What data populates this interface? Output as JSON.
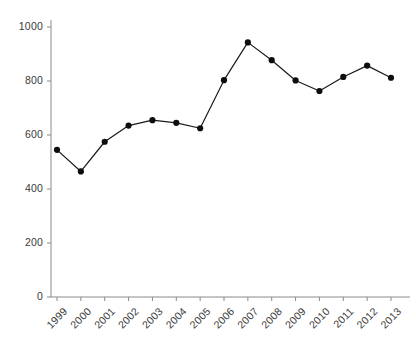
{
  "chart_data": {
    "type": "line",
    "title": "",
    "subtitle": "",
    "xlabel": "",
    "ylabel": "",
    "categories": [
      "1999",
      "2000",
      "2001",
      "2002",
      "2003",
      "2004",
      "2005",
      "2006",
      "2007",
      "2008",
      "2009",
      "2010",
      "2011",
      "2012",
      "2013"
    ],
    "values": [
      545,
      465,
      575,
      635,
      655,
      645,
      625,
      803,
      943,
      877,
      802,
      763,
      815,
      857,
      812
    ],
    "series": [
      {
        "name": "",
        "values": [
          545,
          465,
          575,
          635,
          655,
          645,
          625,
          803,
          943,
          877,
          802,
          763,
          815,
          857,
          812
        ]
      }
    ],
    "ylim": [
      0,
      1000
    ],
    "yticks": [
      0,
      200,
      400,
      600,
      800,
      1000
    ],
    "ytick_labels": [
      "0",
      "200",
      "400",
      "600",
      "800",
      "1000"
    ],
    "xtick_labels": [
      "1999",
      "2000",
      "2001",
      "2002",
      "2003",
      "2004",
      "2005",
      "2006",
      "2007",
      "2008",
      "2009",
      "2010",
      "2011",
      "2012",
      "2013"
    ],
    "grid": false,
    "legend": false,
    "legend_position": "none",
    "marker": "circle",
    "line_color": "#1a1a1a",
    "marker_color": "#0d0d0d",
    "axis_color": "#8a8a8a",
    "background_color": "#ffffff",
    "xtick_rotation": -45
  },
  "axes": {
    "y_axis_name": "y-axis",
    "x_axis_name": "x-axis"
  }
}
